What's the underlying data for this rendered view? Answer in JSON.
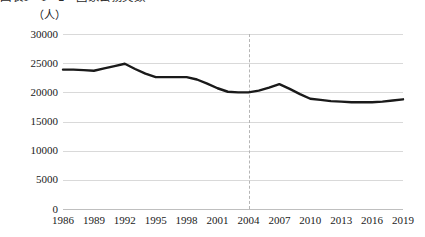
{
  "chart_title": "図表1－1－2　国家公務員数",
  "unit_label": "（人）",
  "chart_data": {
    "type": "line",
    "title": "図表1－1－2　国家公務員数",
    "xlabel": "",
    "ylabel": "（人）",
    "ylim": [
      0,
      30000
    ],
    "xlim": [
      1986,
      2019
    ],
    "grid": true,
    "legend": false,
    "y_ticks": [
      0,
      5000,
      10000,
      15000,
      20000,
      25000,
      30000
    ],
    "y_tick_labels": [
      "0",
      "5000",
      "10000",
      "15000",
      "20000",
      "25000",
      "30000"
    ],
    "x_ticks": [
      1986,
      1989,
      1992,
      1995,
      1998,
      2001,
      2004,
      2007,
      2010,
      2013,
      2016,
      2019
    ],
    "x_tick_labels": [
      "1986",
      "1989",
      "1992",
      "1995",
      "1998",
      "2001",
      "2004",
      "2007",
      "2010",
      "2013",
      "2016",
      "2019"
    ],
    "line_color": "#1a1a1a",
    "line_width": 2.4,
    "annotations": [
      {
        "type": "vertical-dashed-line",
        "x": 2004,
        "color": "#b5b5b5"
      }
    ],
    "x": [
      1986,
      1987,
      1988,
      1989,
      1990,
      1991,
      1992,
      1993,
      1994,
      1995,
      1996,
      1997,
      1998,
      1999,
      2000,
      2001,
      2002,
      2003,
      2004,
      2005,
      2006,
      2007,
      2008,
      2009,
      2010,
      2011,
      2012,
      2013,
      2014,
      2015,
      2016,
      2017,
      2018,
      2019
    ],
    "values": [
      23900,
      23900,
      23800,
      23700,
      24100,
      24500,
      24900,
      24000,
      23200,
      22600,
      22600,
      22600,
      22600,
      22200,
      21500,
      20700,
      20100,
      20000,
      20000,
      20300,
      20800,
      21400,
      20600,
      19700,
      18900,
      18700,
      18500,
      18400,
      18300,
      18300,
      18300,
      18400,
      18600,
      18800
    ]
  }
}
